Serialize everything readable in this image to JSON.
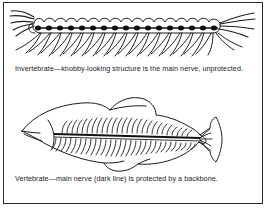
{
  "figure": {
    "border_color": "#2b2b2b",
    "background_color": "#ffffff",
    "ink_color": "#1c1c1c",
    "panels": [
      {
        "id": "invertebrate",
        "illustration_name": "centipede-line-drawing",
        "caption": "Invertebrate—knobby-looking structure is the main nerve, unprotected.",
        "nerve_label": "main nerve",
        "nerve_style": "knobby",
        "nerve_segment_count": 17,
        "nerve_color": "#111111",
        "protection": "unprotected"
      },
      {
        "id": "vertebrate",
        "illustration_name": "fish-skeleton-line-drawing",
        "caption": "Vertebrate—main nerve (dark line) is protected by a backbone.",
        "nerve_label": "main nerve (dark line)",
        "nerve_style": "dark line",
        "nerve_color": "#111111",
        "protection": "protected by a backbone",
        "dorsal_spine_count": 26,
        "rib_count": 30
      }
    ]
  }
}
